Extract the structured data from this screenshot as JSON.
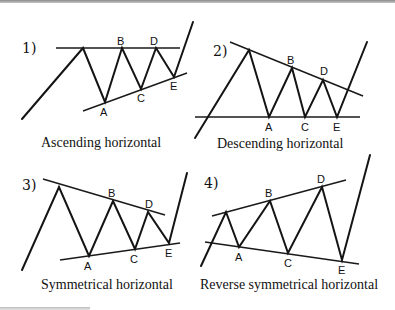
{
  "figure": {
    "panels": [
      {
        "number": "1)",
        "caption": "Ascending horizontal",
        "points": {
          "A": "A",
          "B": "B",
          "C": "C",
          "D": "D",
          "E": "E"
        }
      },
      {
        "number": "2)",
        "caption": "Descending horizontal",
        "points": {
          "A": "A",
          "B": "B",
          "C": "C",
          "D": "D",
          "E": "E"
        }
      },
      {
        "number": "3)",
        "caption": "Symmetrical horizontal",
        "points": {
          "A": "A",
          "B": "B",
          "C": "C",
          "D": "D",
          "E": "E"
        }
      },
      {
        "number": "4)",
        "caption": "Reverse symmetrical horizontal",
        "points": {
          "A": "A",
          "B": "B",
          "C": "C",
          "D": "D",
          "E": "E"
        }
      }
    ]
  }
}
